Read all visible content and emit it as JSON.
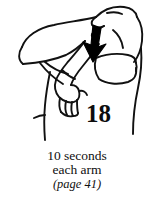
{
  "illustration": {
    "alt_name": "overhead-triceps-stretch-figure",
    "description": "Line drawing of a person performing an overhead triceps stretch: one arm bent behind the head with the opposite hand gripping the elbow and pulling down",
    "arrow": {
      "name": "downward-pull-arrow",
      "direction": "down",
      "color": "#000000"
    },
    "line_color": "#111111",
    "background_color": "#ffffff"
  },
  "exercise": {
    "number": "18",
    "number_color": "#0d0d0d"
  },
  "caption": {
    "duration": "10 seconds",
    "side": "each arm",
    "page_reference": "(page 41)"
  }
}
